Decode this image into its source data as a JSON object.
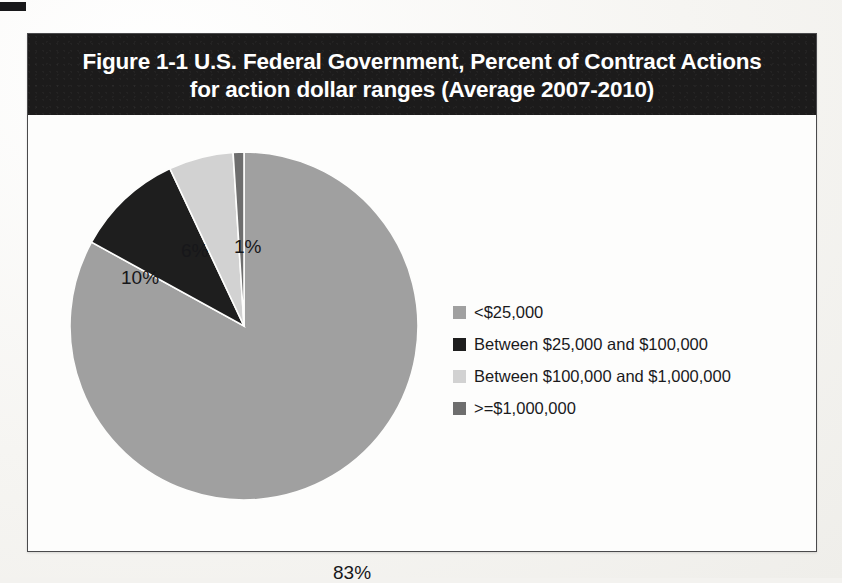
{
  "figure": {
    "title_line_1": "Figure 1-1  U.S. Federal Government, Percent of Contract Actions",
    "title_line_2": "for action dollar ranges (Average 2007-2010)"
  },
  "chart_data": {
    "type": "pie",
    "title": "Figure 1-1  U.S. Federal Government, Percent of Contract Actions for action dollar ranges (Average 2007-2010)",
    "xlabel": "",
    "ylabel": "",
    "legend_position": "right",
    "grid": false,
    "categories": [
      "<$25,000",
      "Between $25,000 and $100,000",
      "Between $100,000 and $1,000,000",
      ">=$1,000,000"
    ],
    "values": [
      83,
      10,
      6,
      1
    ],
    "value_labels": [
      "83%",
      "10%",
      "6%",
      "1%"
    ],
    "colors": [
      "#a0a0a0",
      "#1e1e1e",
      "#d2d2d2",
      "#6e6e6e"
    ],
    "start_angle_deg": 0,
    "direction": "clockwise"
  },
  "legend": {
    "items": [
      {
        "label": "<$25,000",
        "color": "#a0a0a0"
      },
      {
        "label": "Between $25,000 and $100,000",
        "color": "#1e1e1e"
      },
      {
        "label": "Between $100,000 and $1,000,000",
        "color": "#d2d2d2"
      },
      {
        "label": ">=$1,000,000",
        "color": "#6e6e6e"
      }
    ]
  },
  "scan": {
    "ghost_lines": [
      "the contract",
      "What to Do",
      "and the"
    ]
  }
}
